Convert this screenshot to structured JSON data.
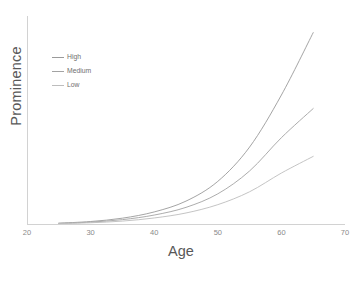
{
  "chart_data": {
    "type": "line",
    "title": "",
    "xlabel": "Age",
    "ylabel": "Prominence",
    "xlim": [
      20,
      70
    ],
    "ylim": [
      0,
      1
    ],
    "xticks": [
      "20",
      "30",
      "40",
      "50",
      "60",
      "70"
    ],
    "xtick_values": [
      20,
      30,
      40,
      50,
      60,
      70
    ],
    "yticks": [],
    "grid": false,
    "legend_position": "upper-left-inside",
    "x": [
      25,
      30,
      35,
      40,
      45,
      50,
      55,
      60,
      65
    ],
    "series": [
      {
        "name": "High",
        "color": "#9a9a9a",
        "values": [
          0.004,
          0.012,
          0.028,
          0.058,
          0.11,
          0.205,
          0.37,
          0.62,
          0.92
        ]
      },
      {
        "name": "Medium",
        "color": "#a3a3a3",
        "values": [
          0.003,
          0.009,
          0.021,
          0.043,
          0.08,
          0.145,
          0.255,
          0.415,
          0.555
        ]
      },
      {
        "name": "Low",
        "color": "#bdbdbd",
        "values": [
          0.002,
          0.006,
          0.014,
          0.029,
          0.053,
          0.093,
          0.155,
          0.245,
          0.325
        ]
      }
    ]
  },
  "legend": {
    "items": [
      {
        "label": "High"
      },
      {
        "label": "Medium"
      },
      {
        "label": "Low"
      }
    ]
  },
  "axes": {
    "x_title": "Age",
    "y_title": "Prominence"
  },
  "colors": {
    "background": "#ffffff",
    "spine": "#d2d2d2",
    "axis_title_text": "#585858",
    "tick_text": "#8a8a8a",
    "legend_text": "#6f6f6f"
  }
}
